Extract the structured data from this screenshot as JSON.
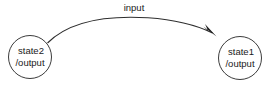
{
  "diagram": {
    "type": "state-transition-diagram",
    "background_color": "#ffffff",
    "stroke_color": "#3c3c3c",
    "text_color": "#1a1a1a",
    "states": [
      {
        "id": "state2",
        "name_label": "state2",
        "output_label": "/output",
        "cx": 30,
        "cy": 57,
        "r": 21.5
      },
      {
        "id": "state1",
        "name_label": "state1",
        "output_label": "/output",
        "cx": 240,
        "cy": 58,
        "r": 21.5
      }
    ],
    "transitions": [
      {
        "id": "t1",
        "from": "state2",
        "to": "state1",
        "label": "input",
        "label_x": 134,
        "label_y": 8,
        "direction": "left-to-right",
        "shape": "arc-upward"
      }
    ]
  }
}
